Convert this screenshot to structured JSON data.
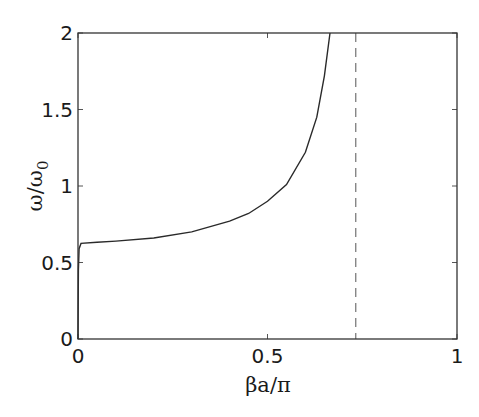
{
  "chart_data": {
    "type": "line",
    "title": "",
    "xlabel": "βa/π",
    "ylabel": "ω/ω0",
    "ylabel_main": "ω/ω",
    "ylabel_sub": "0",
    "xlim": [
      0,
      1
    ],
    "ylim": [
      0,
      2
    ],
    "grid": false,
    "legend": null,
    "xticks": [
      0,
      0.5,
      1
    ],
    "xtick_labels": [
      "0",
      "0.5",
      "1"
    ],
    "yticks": [
      0,
      0.5,
      1,
      1.5,
      2
    ],
    "ytick_labels": [
      "0",
      "0.5",
      "1",
      "1.5",
      "2"
    ],
    "series": [
      {
        "name": "dispersion",
        "style": "solid",
        "color": "#2a2a2a",
        "x": [
          0,
          0.001,
          0.003,
          0.008,
          0.05,
          0.1,
          0.2,
          0.3,
          0.4,
          0.45,
          0.5,
          0.55,
          0.6,
          0.63,
          0.65,
          0.665
        ],
        "y": [
          0,
          0.45,
          0.59,
          0.625,
          0.632,
          0.64,
          0.66,
          0.7,
          0.77,
          0.82,
          0.9,
          1.01,
          1.22,
          1.45,
          1.72,
          2.0
        ]
      }
    ],
    "annotations": [
      {
        "type": "vline",
        "x": 0.733,
        "style": "dashed",
        "color": "#555555"
      }
    ]
  }
}
